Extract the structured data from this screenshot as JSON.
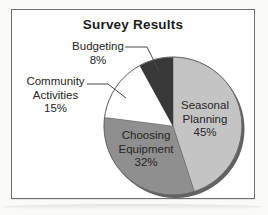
{
  "chart": {
    "title": "Survey Results"
  },
  "chart_data": {
    "type": "pie",
    "title": "Survey Results",
    "categories": [
      "Seasonal Planning",
      "Choosing Equipment",
      "Community Activities",
      "Budgeting"
    ],
    "values": [
      45,
      32,
      15,
      8
    ],
    "unit": "percent",
    "start_angle_deg": 0,
    "direction": "clockwise",
    "legend": "none",
    "slices": [
      {
        "label": "Seasonal Planning",
        "value": 45,
        "pct_text": "45%",
        "color": "#c4c4c4",
        "label_placement": "inside",
        "label_lines": [
          "Seasonal",
          "Planning",
          "45%"
        ]
      },
      {
        "label": "Choosing Equipment",
        "value": 32,
        "pct_text": "32%",
        "color": "#8f8f8f",
        "label_placement": "inside",
        "label_lines": [
          "Choosing",
          "Equipment",
          "32%"
        ]
      },
      {
        "label": "Community Activities",
        "value": 15,
        "pct_text": "15%",
        "color": "#ffffff",
        "label_placement": "outside-left",
        "label_lines": [
          "Community",
          "Activities",
          "15%"
        ]
      },
      {
        "label": "Budgeting",
        "value": 8,
        "pct_text": "8%",
        "color": "#383838",
        "label_placement": "outside-top",
        "label_lines": [
          "Budgeting",
          "8%"
        ]
      }
    ],
    "style": {
      "shadow_color": "#616161",
      "rim_color": "#6a6a6a",
      "leader_line_color": "#4a4a4a",
      "frame_border_color": "#6e6e6e",
      "title_color": "#1c1c1c",
      "label_text_color": "#262626"
    }
  }
}
